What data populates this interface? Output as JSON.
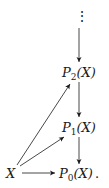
{
  "diagram": {
    "nodes": {
      "ellipsis": "⋮",
      "p2": {
        "letter": "P",
        "index": "2",
        "arg": "(X)"
      },
      "p1": {
        "letter": "P",
        "index": "1",
        "arg": "(X)"
      },
      "p0": {
        "letter": "P",
        "index": "0",
        "arg": "(X)",
        "trailing": "."
      },
      "x": "X"
    },
    "edges": [
      {
        "from": "ellipsis",
        "to": "p2"
      },
      {
        "from": "p2",
        "to": "p1"
      },
      {
        "from": "p1",
        "to": "p0"
      },
      {
        "from": "x",
        "to": "p2"
      },
      {
        "from": "x",
        "to": "p1"
      },
      {
        "from": "x",
        "to": "p0"
      }
    ],
    "colors": {
      "ink": "#1a1a1a",
      "background": "#ffffff"
    }
  }
}
